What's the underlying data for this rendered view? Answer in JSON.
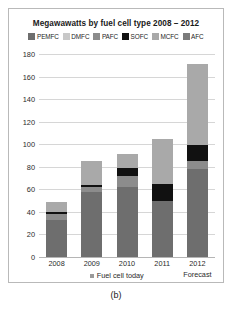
{
  "caption": "(b)",
  "series_legend": {
    "marker_label": "Fuel cell today",
    "marker_color": "#9a9a9a"
  },
  "forecast_note": "Forecast",
  "colors": {
    "PEMFC": "#6e6e6e",
    "DMFC": "#c8c8c8",
    "PAFC": "#8c8c8c",
    "SOFC": "#111111",
    "MCFC": "#a9a9a9",
    "AFC": "#7b7b7b",
    "gridline": "#d6d6d6",
    "frame": "#b9b9b9"
  },
  "chart_data": {
    "type": "bar",
    "subtype": "stacked",
    "title": "Megawawatts by fuel cell type 2008 – 2012",
    "xlabel": "",
    "ylabel": "",
    "ylim": [
      0,
      180
    ],
    "yticks": [
      180,
      160,
      140,
      120,
      100,
      80,
      60,
      40,
      20,
      0
    ],
    "grid": true,
    "legend_position": "top",
    "categories": [
      "2008",
      "2009",
      "2010",
      "2011",
      "2012"
    ],
    "series": [
      {
        "name": "PEMFC",
        "values": [
          33,
          58,
          62,
          50,
          78
        ]
      },
      {
        "name": "DMFC",
        "values": [
          0,
          0,
          0,
          0,
          0
        ]
      },
      {
        "name": "PAFC",
        "values": [
          5,
          4,
          10,
          0,
          7
        ]
      },
      {
        "name": "SOFC",
        "values": [
          2,
          2,
          7,
          15,
          14
        ]
      },
      {
        "name": "MCFC",
        "values": [
          9,
          21,
          12,
          40,
          72
        ]
      },
      {
        "name": "AFC",
        "values": [
          0,
          0,
          0,
          0,
          0
        ]
      }
    ],
    "totals": [
      49,
      85,
      91,
      105,
      171
    ],
    "annotations": [
      "Forecast",
      "Fuel cell today"
    ]
  }
}
